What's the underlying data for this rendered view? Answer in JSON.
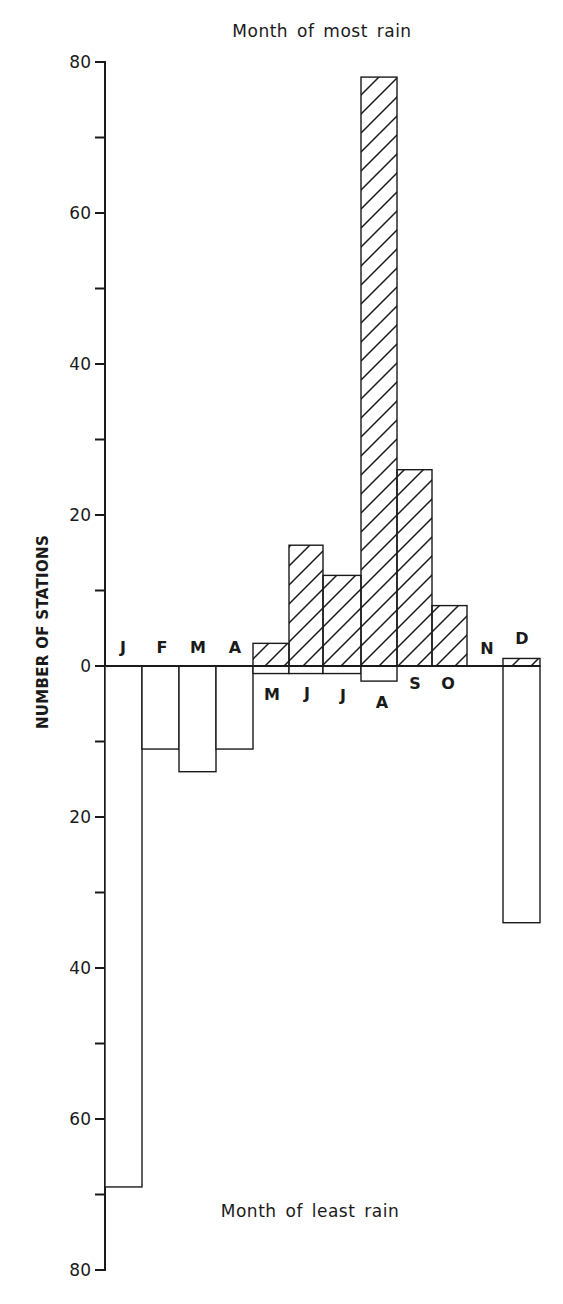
{
  "chart": {
    "top_title": "Month of most rain",
    "bottom_title": "Month of least rain",
    "y_axis_title": "NUMBER OF STATIONS",
    "hatch_color": "#1a1a1a",
    "background": "#ffffff"
  },
  "chart_data": {
    "type": "bar",
    "xlabel": "",
    "ylabel": "NUMBER OF STATIONS",
    "categories": [
      "J",
      "F",
      "M",
      "A",
      "M",
      "J",
      "J",
      "A",
      "S",
      "O",
      "N",
      "D"
    ],
    "month_names": [
      "January",
      "February",
      "March",
      "April",
      "May",
      "June",
      "July",
      "August",
      "September",
      "October",
      "November",
      "December"
    ],
    "series": [
      {
        "name": "Month of most rain",
        "direction": "up",
        "fill": "hatched",
        "values": [
          0,
          0,
          0,
          0,
          3,
          16,
          12,
          78,
          26,
          8,
          0,
          1
        ]
      },
      {
        "name": "Month of least rain",
        "direction": "down",
        "fill": "open",
        "values": [
          69,
          11,
          14,
          11,
          1,
          1,
          1,
          2,
          0,
          0,
          0,
          34
        ]
      }
    ],
    "y_ticks_up": [
      0,
      20,
      40,
      60,
      80
    ],
    "y_ticks_down": [
      20,
      40,
      60,
      80
    ],
    "y_minor_tick_step": 10,
    "ylim": [
      -80,
      80
    ],
    "grid": false,
    "legend": "none; upper half labeled 'Month of most rain', lower half labeled 'Month of least rain'"
  }
}
